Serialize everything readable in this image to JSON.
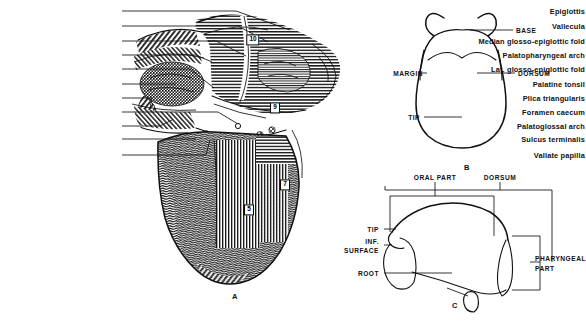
{
  "plate": {
    "background": "#ffffff",
    "ink": "#111111"
  },
  "figureA": {
    "id": "A",
    "caption": "A",
    "labels": [
      {
        "text": "Epiglottis",
        "y": 11
      },
      {
        "text": "Vallecula",
        "y": 26
      },
      {
        "text": "Median glosso-epiglottic fold",
        "y": 41
      },
      {
        "text": "Palatopharyngeal arch",
        "y": 55
      },
      {
        "text": "Lat. glosso-epiglottic fold",
        "y": 69
      },
      {
        "text": "Palatine tonsil",
        "y": 84
      },
      {
        "text": "Plica triangularis",
        "y": 98
      },
      {
        "text": "Foramen caecum",
        "y": 112
      },
      {
        "text": "Palatoglossal arch",
        "y": 126
      },
      {
        "text": "Sulcus terminalis",
        "y": 139
      },
      {
        "text": "Vallate papilla",
        "y": 155
      }
    ],
    "callouts": [
      {
        "number": "10",
        "x": 253,
        "y": 40
      },
      {
        "number": "9",
        "x": 275,
        "y": 108
      },
      {
        "number": "7",
        "x": 285,
        "y": 185
      },
      {
        "number": "5",
        "x": 249,
        "y": 210
      }
    ]
  },
  "figureB": {
    "id": "B",
    "caption": "B",
    "labels": [
      {
        "text": "BASE",
        "x": 516,
        "y": 30,
        "align": "left"
      },
      {
        "text": "MARGIN",
        "x": 423,
        "y": 73,
        "align": "right"
      },
      {
        "text": "DORSUM",
        "x": 518,
        "y": 73,
        "align": "left"
      },
      {
        "text": "TIP",
        "x": 420,
        "y": 117,
        "align": "right"
      }
    ]
  },
  "figureC": {
    "id": "C",
    "caption": "C",
    "labels": [
      {
        "text": "ORAL PART",
        "x": 435,
        "y": 177,
        "align": "center"
      },
      {
        "text": "DORSUM",
        "x": 500,
        "y": 177,
        "align": "center"
      },
      {
        "text": "TIP",
        "x": 379,
        "y": 229,
        "align": "right"
      },
      {
        "text": "INF.",
        "x": 379,
        "y": 241,
        "align": "right"
      },
      {
        "text": "SURFACE",
        "x": 379,
        "y": 250,
        "align": "right"
      },
      {
        "text": "ROOT",
        "x": 379,
        "y": 273,
        "align": "right"
      },
      {
        "text": "PHARYNGEAL",
        "x": 535,
        "y": 258,
        "align": "left"
      },
      {
        "text": "PART",
        "x": 535,
        "y": 268,
        "align": "left"
      }
    ]
  }
}
